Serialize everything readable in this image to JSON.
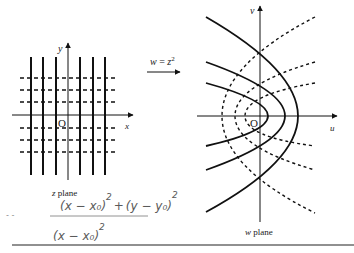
{
  "figure": {
    "z_plane": {
      "x_axis_label": "x",
      "y_axis_label": "y",
      "origin_label": "O",
      "caption_italic": "z",
      "caption_rest": " plane",
      "vertical_lines_x": [
        31,
        43,
        56,
        80,
        93,
        105
      ],
      "dashed_lines_y": [
        78,
        90,
        102,
        128,
        140,
        152
      ]
    },
    "mapping": {
      "label_lhs": "w",
      "label_eq": " = ",
      "label_rhs": "z",
      "label_exp": "2"
    },
    "w_plane": {
      "u_axis_label": "u",
      "v_axis_label": "v",
      "origin_label": "O",
      "caption_italic": "w",
      "caption_rest": " plane",
      "solid_parabola_vertices_u": [
        268,
        285,
        298
      ],
      "dashed_parabola_vertices_u": [
        222,
        235,
        245
      ]
    },
    "handwriting": {
      "numerator_a": "(x − x₀)",
      "numerator_a_exp": "2",
      "numerator_op": "+",
      "numerator_b": "(y − y₀)",
      "numerator_b_exp": "2",
      "denominator": "(x − x₀)",
      "denominator_exp": "2",
      "stray_marks": "- -"
    }
  }
}
